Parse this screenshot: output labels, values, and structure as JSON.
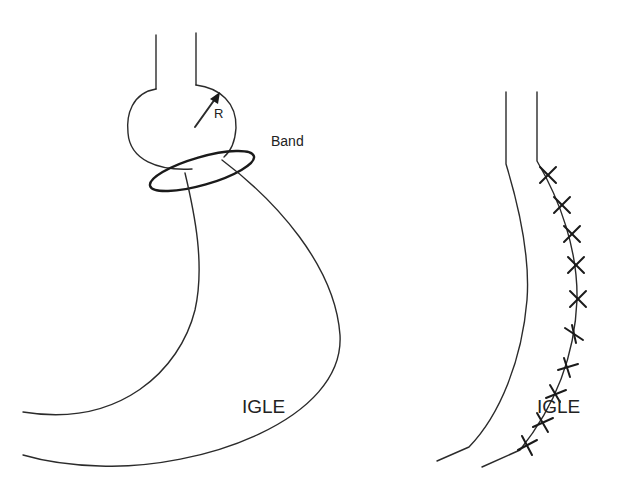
{
  "diagram": {
    "left_panel": {
      "name": "Gastric band (LAGB) with pouch",
      "labels": {
        "radius": "R",
        "band": "Band",
        "segment": "IGLE"
      }
    },
    "right_panel": {
      "name": "Sleeve gastrectomy with staple line",
      "labels": {
        "segment": "IGLE"
      },
      "suture_marks_count": 10
    },
    "colors": {
      "line": "#2b2b2b",
      "background": "#ffffff"
    }
  }
}
